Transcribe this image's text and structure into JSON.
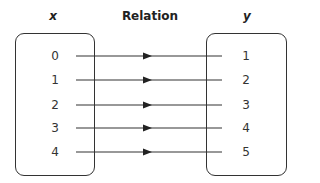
{
  "headers": {
    "x": "x",
    "relation": "Relation",
    "y": "y"
  },
  "domain": [
    "0",
    "1",
    "2",
    "3",
    "4"
  ],
  "range": [
    "1",
    "2",
    "3",
    "4",
    "5"
  ],
  "mapping": [
    [
      "0",
      "1"
    ],
    [
      "1",
      "2"
    ],
    [
      "2",
      "3"
    ],
    [
      "3",
      "4"
    ],
    [
      "4",
      "5"
    ]
  ]
}
